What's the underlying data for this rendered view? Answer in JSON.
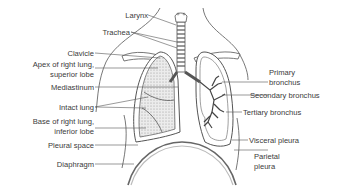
{
  "diagram": {
    "labels_left": [
      {
        "id": "larynx",
        "text": "Larynx"
      },
      {
        "id": "trachea",
        "text": "Trachea"
      },
      {
        "id": "clavicle",
        "text": "Clavicle"
      },
      {
        "id": "apex",
        "text": "Apex of right lung,",
        "text2": "superior lobe"
      },
      {
        "id": "mediastinum",
        "text": "Mediastinum"
      },
      {
        "id": "intact_lung",
        "text": "Intact lung"
      },
      {
        "id": "base",
        "text": "Base of right lung,",
        "text2": "inferior lobe"
      },
      {
        "id": "pleural_space",
        "text": "Pleural space"
      },
      {
        "id": "diaphragm",
        "text": "Diaphragm"
      }
    ],
    "labels_right": [
      {
        "id": "primary_bronchus",
        "text": "Primary",
        "text2": "bronchus"
      },
      {
        "id": "secondary_bronchus",
        "text": "Secondary bronchus"
      },
      {
        "id": "tertiary_bronchus",
        "text": "Tertiary bronchus"
      },
      {
        "id": "visceral_pleura",
        "text": "Visceral pleura"
      },
      {
        "id": "parietal_pleura",
        "text": "Parietal",
        "text2": "pleura"
      }
    ],
    "colors": {
      "line": "#444444",
      "text": "#3a3a3a",
      "lung_fill": "#e4e4e4",
      "pleura": "#bdbdbd"
    }
  }
}
